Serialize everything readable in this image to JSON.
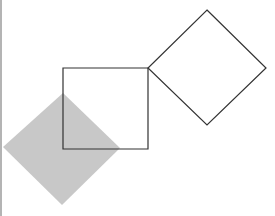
{
  "canvas": {
    "width": 275,
    "height": 216,
    "background": "#ffffff"
  },
  "edge_bar": {
    "color": "#b4b4b4"
  },
  "shapes": {
    "square": {
      "points": "63,68 148,68 148,149 63,149",
      "stroke": "#333333",
      "fill": "none"
    },
    "outline_diamond": {
      "points": "207,10 266,68 207,125 148,68",
      "stroke": "#333333",
      "fill": "none"
    },
    "shaded_diamond": {
      "points": "63,93 120,148 62,205 3,147",
      "stroke": "none",
      "fill": "#c8c8c8"
    }
  }
}
